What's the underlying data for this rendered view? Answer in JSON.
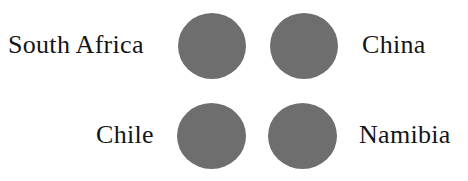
{
  "figure": {
    "background_color": "#ffffff",
    "swatch_color": "#6e6e6e",
    "label_color": "#151515",
    "layout": "2x2 grid of circular color swatches with country labels on the outer sides"
  },
  "chart_data": {
    "type": "table",
    "title": "",
    "categories": [
      "South Africa",
      "China",
      "Chile",
      "Namibia"
    ],
    "values": [
      1,
      1,
      1,
      1
    ],
    "series": [
      {
        "name": "swatch",
        "values": [
          "#6e6e6e",
          "#6e6e6e",
          "#6e6e6e",
          "#6e6e6e"
        ]
      }
    ],
    "legend_position": "inline",
    "grid": false
  },
  "rows": [
    {
      "left_label": "South Africa",
      "left_swatch_color": "#6e6e6e",
      "right_swatch_color": "#6e6e6e",
      "right_label": "China"
    },
    {
      "left_label": "Chile",
      "left_swatch_color": "#6e6e6e",
      "right_swatch_color": "#6e6e6e",
      "right_label": "Namibia"
    }
  ]
}
